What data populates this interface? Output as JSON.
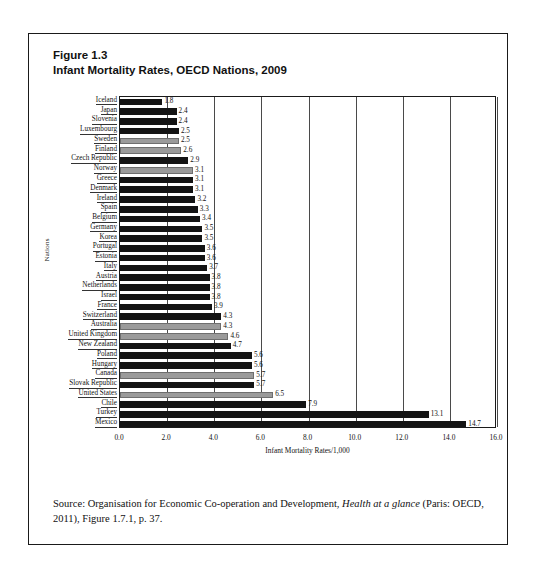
{
  "figure": {
    "number": "Figure 1.3",
    "title": "Infant Mortality Rates, OECD Nations, 2009",
    "source_prefix": "Source: Organisation for Economic Co-operation and Development, ",
    "source_italic": "Health at a glance",
    "source_suffix": " (Paris: OECD, 2011), Figure 1.7.1, p. 37."
  },
  "chart_data": {
    "type": "bar",
    "orientation": "horizontal",
    "title": "Infant Mortality Rates, OECD Nations, 2009",
    "xlabel": "Infant Mortality Rates/1,000",
    "ylabel": "Nations",
    "xlim": [
      0.0,
      16.0
    ],
    "xticks": [
      "0.0",
      "2.0",
      "4.0",
      "6.0",
      "8.0",
      "10.0",
      "12.0",
      "14.0",
      "16.0"
    ],
    "xtick_values": [
      0,
      2,
      4,
      6,
      8,
      10,
      12,
      14,
      16
    ],
    "grid": "vertical",
    "legend": "none",
    "categories": [
      "Iceland",
      "Japan",
      "Slovenia",
      "Luxembourg",
      "Sweden",
      "Finland",
      "Czech Republic",
      "Norway",
      "Greece",
      "Denmark",
      "Ireland",
      "Spain",
      "Belgium",
      "Germany",
      "Korea",
      "Portugal",
      "Estonia",
      "Italy",
      "Austria",
      "Netherlands",
      "Israel",
      "France",
      "Switzerland",
      "Australia",
      "United Kingdom",
      "New Zealand",
      "Poland",
      "Hungary",
      "Canada",
      "Slovak Republic",
      "United States",
      "Chile",
      "Turkey",
      "Mexico"
    ],
    "values": [
      1.8,
      2.4,
      2.4,
      2.5,
      2.5,
      2.6,
      2.9,
      3.1,
      3.1,
      3.1,
      3.2,
      3.3,
      3.4,
      3.5,
      3.5,
      3.6,
      3.6,
      3.7,
      3.8,
      3.8,
      3.8,
      3.9,
      4.3,
      4.3,
      4.6,
      4.7,
      5.6,
      5.6,
      5.7,
      5.7,
      6.5,
      7.9,
      13.1,
      14.7
    ],
    "value_labels": [
      "1.8",
      "2.4",
      "2.4",
      "2.5",
      "2.5",
      "2.6",
      "2.9",
      "3.1",
      "3.1",
      "3.1",
      "3.2",
      "3.3",
      "3.4",
      "3.5",
      "3.5",
      "3.6",
      "3.6",
      "3.7",
      "3.8",
      "3.8",
      "3.8",
      "3.9",
      "4.3",
      "4.3",
      "4.6",
      "4.7",
      "5.6",
      "5.6",
      "5.7",
      "5.7",
      "6.5",
      "7.9",
      "13.1",
      "14.7"
    ],
    "bar_styles": [
      "dark",
      "dark",
      "dark",
      "dark",
      "gray",
      "gray",
      "dark",
      "gray",
      "dark",
      "dark",
      "dark",
      "dark",
      "dark",
      "dark",
      "dark",
      "dark",
      "dark",
      "dark",
      "dark",
      "dark",
      "dark",
      "dark",
      "dark",
      "gray",
      "gray",
      "dark",
      "dark",
      "dark",
      "gray",
      "dark",
      "gray",
      "dark",
      "dark",
      "dark"
    ],
    "colors": {
      "bar_dark": "#141414",
      "bar_gray": "#9a9a9a",
      "grid": "#4a4a4a",
      "axis": "#1a1a1a"
    }
  }
}
